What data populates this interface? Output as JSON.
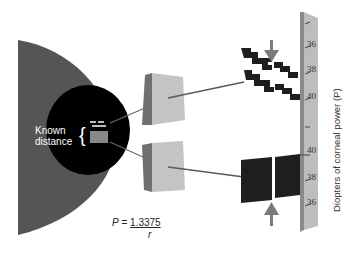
{
  "diagram": {
    "labels": {
      "known_distance_line1": "Known",
      "known_distance_line2": "distance",
      "brace": "{"
    },
    "formula": {
      "lhs": "P = ",
      "numerator": "1.3375",
      "denominator": "r"
    },
    "scale": {
      "axis_label": "Diopters of corneal power (P)",
      "upper_ticks": [
        "36",
        "38",
        "40"
      ],
      "lower_ticks": [
        "40",
        "38",
        "36"
      ]
    },
    "colors": {
      "eye": "#555555",
      "pupil": "#000000",
      "prism": "#c4c4c4",
      "prism_shade": "#707070",
      "ruler": "#bdbdbd",
      "ruler_edge": "#8a8a8a",
      "mire": "#1e1e1e",
      "arrow": "#7a7a7a",
      "ray": "#5a5a5a"
    }
  }
}
